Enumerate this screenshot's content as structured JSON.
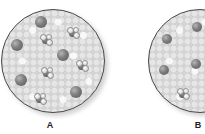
{
  "figure": {
    "panels": [
      {
        "id": "A",
        "label": "A",
        "circle": {
          "cx": 52,
          "cy": 60,
          "r": 51
        },
        "ions": [
          {
            "x": 41,
            "y": 22,
            "r": 6
          },
          {
            "x": 17,
            "y": 45,
            "r": 6
          },
          {
            "x": 63,
            "y": 55,
            "r": 6
          },
          {
            "x": 21,
            "y": 80,
            "r": 6
          },
          {
            "x": 76,
            "y": 92,
            "r": 6
          }
        ],
        "molecules": [
          {
            "x": 46,
            "y": 40
          },
          {
            "x": 73,
            "y": 33
          },
          {
            "x": 82,
            "y": 66
          },
          {
            "x": 47,
            "y": 73
          },
          {
            "x": 40,
            "y": 99
          }
        ]
      },
      {
        "id": "B",
        "label": "B",
        "circle": {
          "cx": 199,
          "cy": 60,
          "r": 51
        },
        "ions": [
          {
            "x": 167,
            "y": 39,
            "r": 5
          },
          {
            "x": 197,
            "y": 27,
            "r": 5
          },
          {
            "x": 164,
            "y": 70,
            "r": 5
          },
          {
            "x": 196,
            "y": 64,
            "r": 5
          }
        ],
        "molecules": [
          {
            "x": 183,
            "y": 94
          }
        ]
      }
    ],
    "colors": {
      "background": "#ffffff",
      "circle_border": "#4a4a4a",
      "solvent": "#d8d8d8",
      "ion": "#6a6a6a",
      "label": "#222222"
    }
  }
}
